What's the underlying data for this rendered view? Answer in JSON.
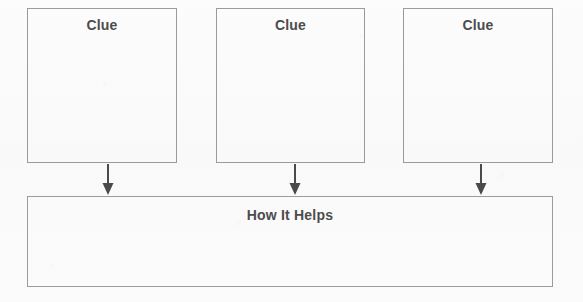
{
  "diagram": {
    "type": "clue-evidence-organizer",
    "background_color": "#fbfbfb",
    "border_color": "#9b9b9b",
    "text_color": "#4c4c4c",
    "arrow_color": "#4a4a4a",
    "clue_boxes": [
      {
        "label": "Clue",
        "x": 27,
        "y": 8,
        "width": 150,
        "height": 155
      },
      {
        "label": "Clue",
        "x": 216,
        "y": 8,
        "width": 149,
        "height": 155
      },
      {
        "label": "Clue",
        "x": 403,
        "y": 8,
        "width": 150,
        "height": 155
      }
    ],
    "arrows": [
      {
        "x": 101,
        "y": 164,
        "height": 32
      },
      {
        "x": 288,
        "y": 164,
        "height": 32
      },
      {
        "x": 474,
        "y": 164,
        "height": 32
      }
    ],
    "result_box": {
      "label": "How It Helps",
      "x": 27,
      "y": 196,
      "width": 526,
      "height": 91
    }
  }
}
